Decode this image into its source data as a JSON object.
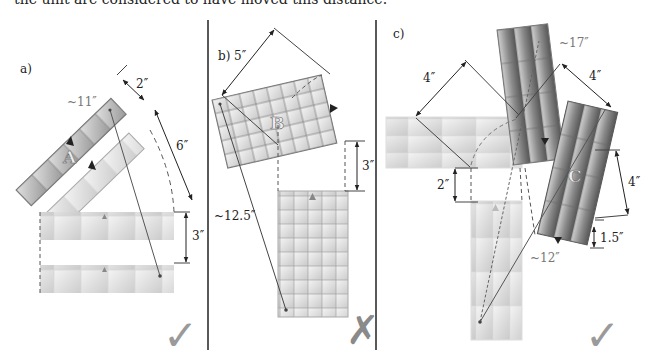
{
  "caption": "the unit are considered to have moved this distance.",
  "panels": [
    {
      "id": "a",
      "label": "a)",
      "unit_label": "A",
      "measures": {
        "width": "2″",
        "wheel": "6″",
        "forward": "3″",
        "total": "~11″"
      },
      "verdict": "check",
      "verdict_symbol": "✓"
    },
    {
      "id": "b",
      "label": "b)",
      "unit_label": "B",
      "measures": {
        "pivot": "5″",
        "forward": "3″",
        "total": "~12.5″"
      },
      "verdict": "cross",
      "verdict_symbol": "✗"
    },
    {
      "id": "c",
      "label": "c)",
      "unit_label": "C",
      "measures": {
        "wheel1": "4″",
        "wheel2": "4″",
        "drop": "2″",
        "forward": "4″",
        "back": "1.5″",
        "total_far": "~17″",
        "total": "~12″"
      },
      "verdict": "check",
      "verdict_symbol": "✓"
    }
  ],
  "colors": {
    "unit_light": "#e6e6e6",
    "unit_mid": "#bdbdbd",
    "unit_dark": "#7a7a7a",
    "line": "#444444",
    "verdict": "#9a9a9a"
  }
}
